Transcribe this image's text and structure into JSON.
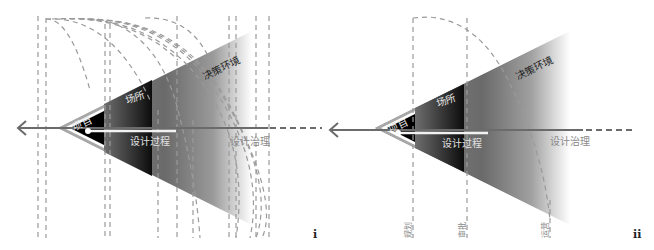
{
  "panels": [
    {
      "id": "i",
      "tag": "i",
      "labels": {
        "project": "项目",
        "place": "场所",
        "design_process": "设计过程",
        "decision_environment": "决策环境",
        "design_governance": "设计治理"
      },
      "vertical_dashed_lines_x": [
        38,
        46,
        105,
        110,
        158,
        177,
        193,
        229,
        236,
        256,
        269
      ],
      "arc_count": 9
    },
    {
      "id": "ii",
      "tag": "ii",
      "labels": {
        "project": "项目",
        "place": "场所",
        "design_process": "设计过程",
        "decision_environment": "决策环境",
        "design_governance": "设计治理"
      },
      "stage_labels": [
        "规划",
        "审批",
        "运营"
      ],
      "vertical_dashed_lines_x": [
        95,
        149,
        232
      ],
      "arc_count": 1
    }
  ],
  "colors": {
    "axis": "#6b6b6b",
    "dashed": "#9a9a9a",
    "wedge_dark": "#5e5e5e",
    "wedge_light": "#ffffff",
    "project_fill": "#000000",
    "place_fill": "#1a1a1a",
    "process_bar": "#f2f2f2",
    "label_light": "#e6e6e6",
    "label_dark": "#222222"
  }
}
